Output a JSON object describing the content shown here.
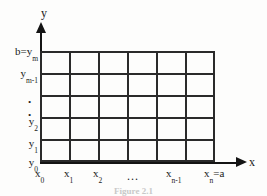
{
  "figure": {
    "caption": "Figure 2.1",
    "ink_color": "#141414",
    "background_color": "#fdfdfc",
    "grid": {
      "columns": 6,
      "rows": 5
    },
    "axes": {
      "x_name": "x",
      "y_name": "y"
    },
    "x_ticks": [
      {
        "label_base": "x",
        "sub": "0",
        "suffix": ""
      },
      {
        "label_base": "x",
        "sub": "1",
        "suffix": ""
      },
      {
        "label_base": "x",
        "sub": "2",
        "suffix": ""
      },
      {
        "label_base": "x",
        "sub": "n-1",
        "suffix": ""
      },
      {
        "label_base": "x",
        "sub": "n",
        "suffix": "=a"
      }
    ],
    "x_ellipsis": "...",
    "y_ticks": [
      {
        "prefix": "b=",
        "label_base": "y",
        "sub": "m"
      },
      {
        "prefix": "",
        "label_base": "y",
        "sub": "m-1"
      },
      {
        "prefix": "",
        "label_base": "y",
        "sub": "2"
      },
      {
        "prefix": "",
        "label_base": "y",
        "sub": "1"
      },
      {
        "prefix": "",
        "label_base": "y",
        "sub": "0"
      }
    ],
    "y_ellipsis_dots": [
      ".",
      "."
    ]
  }
}
